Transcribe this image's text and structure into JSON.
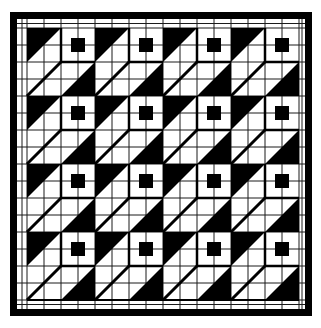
{
  "image": {
    "description": "Black and white quilt pattern of 4x4 repeated cube-like blocks on a grid",
    "width": 321,
    "height": 328
  },
  "quilt": {
    "rows": 4,
    "cols": 4,
    "block_size": 68,
    "origin": [
      27,
      28
    ],
    "grid_step": 17,
    "colors": {
      "background": "#ffffff",
      "ink": "#000000",
      "grid": "#1a1a1a"
    },
    "frame": {
      "outer": [
        10,
        12,
        302,
        304
      ],
      "thickness": 7
    },
    "block_motif": {
      "top_left_triangle": "black",
      "top_right_square": "white with centered black square",
      "bottom_right_triangle": "black",
      "diagonal_line": "thick"
    }
  }
}
